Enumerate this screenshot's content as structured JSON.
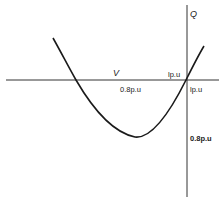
{
  "diagram": {
    "type": "Q-V curve",
    "axes": {
      "horizontal_label": "V",
      "vertical_label": "Q"
    },
    "labels": {
      "v_0_8": "0.8p.u",
      "v_1_above": "lp.u",
      "v_1_below": "lp.u",
      "q_0_8": "0.8p.u"
    },
    "colors": {
      "curve": "#1a1a1a",
      "axis": "#333333",
      "background": "#ffffff"
    }
  }
}
